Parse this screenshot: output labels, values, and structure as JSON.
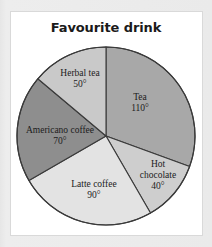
{
  "panel": {
    "background_color": "#ffffff",
    "border_color": "#d9d9d9"
  },
  "chart": {
    "title": "Favourite drink"
  },
  "chart_data": {
    "type": "pie",
    "title": "Favourite drink",
    "units": "degrees",
    "total_degrees": 360,
    "value_suffix": "°",
    "start_angle_deg": 0,
    "direction": "clockwise",
    "legend": "none",
    "labels_inside_slices": true,
    "categories": [
      "Tea",
      "Hot chocolate",
      "Latte coffee",
      "Americano coffee",
      "Herbal tea"
    ],
    "values": [
      110,
      40,
      90,
      70,
      50
    ],
    "colors": [
      "#a8a8a8",
      "#cecece",
      "#e3e3e3",
      "#8e8e8e",
      "#c9c9c9"
    ],
    "slices": [
      {
        "name": "Tea",
        "label_line1": "Tea",
        "label_line2": "110°",
        "value": 110,
        "color": "#a8a8a8",
        "label_x": 140,
        "label_y": 103
      },
      {
        "name": "Hot chocolate",
        "label_line1": "Hot",
        "label_line2": "chocolate",
        "label_line3": "40°",
        "value": 40,
        "color": "#cecece",
        "label_x": 158,
        "label_y": 176
      },
      {
        "name": "Latte coffee",
        "label_line1": "Latte coffee",
        "label_line2": "90°",
        "value": 90,
        "color": "#e3e3e3",
        "label_x": 94,
        "label_y": 190
      },
      {
        "name": "Americano coffee",
        "label_line1": "Americano coffee",
        "label_line2": "70°",
        "value": 70,
        "color": "#8e8e8e",
        "label_x": 60,
        "label_y": 136
      },
      {
        "name": "Herbal tea",
        "label_line1": "Herbal tea",
        "label_line2": "50°",
        "value": 50,
        "color": "#c9c9c9",
        "label_x": 80,
        "label_y": 79
      }
    ],
    "geometry": {
      "center_x": 106,
      "center_y": 136,
      "radius": 89,
      "outline_color": "#3a3a3a"
    }
  }
}
